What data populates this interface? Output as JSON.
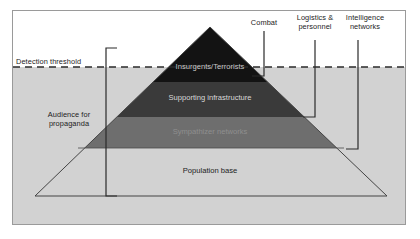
{
  "figure": {
    "background_color": "#ffffff",
    "frame_color": "#9a9a9a",
    "shaded_region_color": "#d2d2d2",
    "threshold_line_color": "#2b2b2b",
    "bracket_color": "#2b2b2b"
  },
  "threshold": {
    "label": "Detection threshold"
  },
  "left_bracket": {
    "label_line1": "Audience for",
    "label_line2": "propaganda",
    "label": "Audience for\npropaganda"
  },
  "pyramid": {
    "bands": [
      {
        "id": "insurgents",
        "label": "Insurgents/Terrorists",
        "fill": "#131313",
        "text_color": "#c8c8c8"
      },
      {
        "id": "supporting-infrastructure",
        "label": "Supporting infrastructure",
        "fill": "#3a3a3a",
        "text_color": "#d8d8d8"
      },
      {
        "id": "sympathizer-networks",
        "label": "Sympathizer networks",
        "fill": "#6e6e6e",
        "text_color": "#8e8e8e"
      },
      {
        "id": "population-base",
        "label": "Population base",
        "fill": "none",
        "text_color": "#1c1c1c"
      }
    ]
  },
  "right_brackets": [
    {
      "id": "combat",
      "label": "Combat",
      "label_line1": "Combat",
      "label_line2": ""
    },
    {
      "id": "logistics-personnel",
      "label": "Logistics &\npersonnel",
      "label_line1": "Logistics &",
      "label_line2": "personnel"
    },
    {
      "id": "intelligence-networks",
      "label": "Intelligence\nnetworks",
      "label_line1": "Intelligence",
      "label_line2": "networks"
    }
  ]
}
